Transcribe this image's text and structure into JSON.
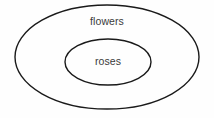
{
  "diagram": {
    "type": "euler-diagram",
    "background_color": "#fefefe",
    "stroke_color": "#1a1a1a",
    "text_color": "#3a3a3a",
    "sets": [
      {
        "id": "outer",
        "label": "flowers",
        "shape": "ellipse",
        "center_x": 107,
        "center_y": 57,
        "radius_x": 92,
        "radius_y": 52,
        "fill": "none",
        "stroke": "#1a1a1a",
        "stroke_width": 1.4,
        "label_x": 107,
        "label_y": 22
      },
      {
        "id": "inner",
        "label": "roses",
        "shape": "ellipse",
        "center_x": 108,
        "center_y": 62,
        "radius_x": 43,
        "radius_y": 23,
        "fill": "none",
        "stroke": "#1a1a1a",
        "stroke_width": 1.4,
        "label_x": 108,
        "label_y": 62
      }
    ]
  }
}
